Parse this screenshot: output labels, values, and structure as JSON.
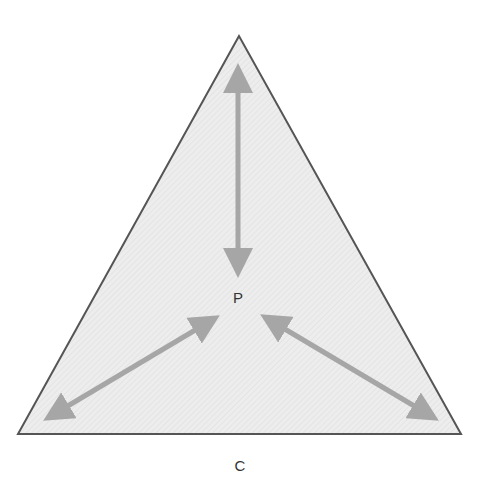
{
  "diagram": {
    "type": "triangle-with-bidirectional-arrows",
    "center_label": "P",
    "base_label": "C",
    "colors": {
      "triangle_fill": "#ececec",
      "triangle_stroke": "#555555",
      "arrow": "#a6a6a6",
      "text": "#333333"
    },
    "arrows": [
      {
        "name": "vertical-arrow",
        "from": [
          238,
          66
        ],
        "to": [
          238,
          275
        ]
      },
      {
        "name": "left-arrow",
        "from": [
          46,
          419
        ],
        "to": [
          217,
          317
        ]
      },
      {
        "name": "right-arrow",
        "from": [
          263,
          316
        ],
        "to": [
          436,
          419
        ]
      }
    ]
  }
}
